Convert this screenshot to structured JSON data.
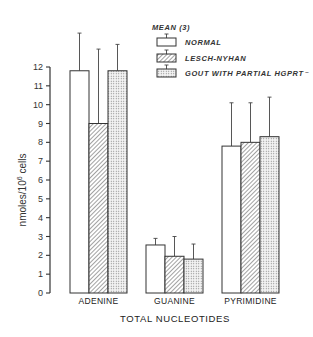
{
  "chart_data": {
    "type": "bar",
    "title": "",
    "xlabel": "TOTAL NUCLEOTIDES",
    "ylabel": "nmoles/10⁶ cells",
    "ylim": [
      0,
      12
    ],
    "yticks": [
      0,
      1,
      2,
      3,
      4,
      5,
      6,
      7,
      8,
      9,
      10,
      11,
      12
    ],
    "grid": false,
    "legend_title": "MEAN (3)",
    "legend_position": "upper right",
    "categories": [
      "ADENINE",
      "GUANINE",
      "PYRIMIDINE"
    ],
    "series": [
      {
        "name": "NORMAL",
        "pattern": "none",
        "values": [
          11.8,
          2.55,
          7.8
        ],
        "error_upper": [
          13.8,
          2.9,
          10.1
        ]
      },
      {
        "name": "LESCH-NYHAN",
        "pattern": "hatch",
        "values": [
          9.0,
          1.95,
          8.0
        ],
        "error_upper": [
          12.95,
          3.0,
          10.1
        ]
      },
      {
        "name": "GOUT WITH PARTIAL HGPRT⁻",
        "pattern": "dots",
        "values": [
          11.8,
          1.8,
          8.3
        ],
        "error_upper": [
          13.2,
          2.6,
          10.4
        ]
      }
    ]
  }
}
